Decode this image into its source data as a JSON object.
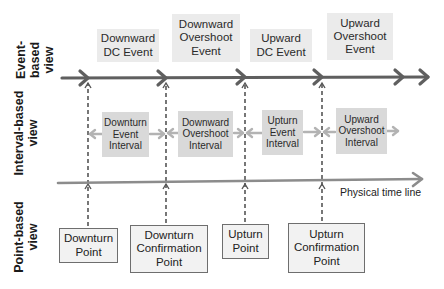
{
  "views": {
    "event": "Event-\nbased\nview",
    "event_lines": [
      "Event-",
      "based",
      "view"
    ],
    "interval_lines": [
      "Interval-based",
      "view"
    ],
    "point_lines": [
      "Point-based",
      "view"
    ]
  },
  "events": [
    {
      "lines": [
        "Downward",
        "DC Event"
      ]
    },
    {
      "lines": [
        "Downward",
        "Overshoot",
        "Event"
      ]
    },
    {
      "lines": [
        "Upward",
        "DC Event"
      ]
    },
    {
      "lines": [
        "Upward",
        "Overshoot",
        "Event"
      ]
    }
  ],
  "intervals": [
    {
      "lines": [
        "Downturn",
        "Event",
        "Interval"
      ]
    },
    {
      "lines": [
        "Downward",
        "Overshoot",
        "Interval"
      ]
    },
    {
      "lines": [
        "Upturn",
        "Event",
        "Interval"
      ]
    },
    {
      "lines": [
        "Upward",
        "Overshoot",
        "Interval"
      ]
    }
  ],
  "points": [
    {
      "lines": [
        "Downturn",
        "Point"
      ]
    },
    {
      "lines": [
        "Downturn",
        "Confirmation",
        "Point"
      ]
    },
    {
      "lines": [
        "Upturn",
        "Point"
      ]
    },
    {
      "lines": [
        "Upturn",
        "Confirmation",
        "Point"
      ]
    }
  ],
  "timeline": {
    "label": "Physical time line"
  },
  "colors": {
    "event_arrow": "#5f5f5f",
    "timeline": "#8c8c8c",
    "interval_arrow": "#b3b3b3",
    "dashed": "#555555",
    "event_box": "#ebebeb",
    "interval_box": "#d9d9d9",
    "point_box": "#f2f2f2"
  }
}
